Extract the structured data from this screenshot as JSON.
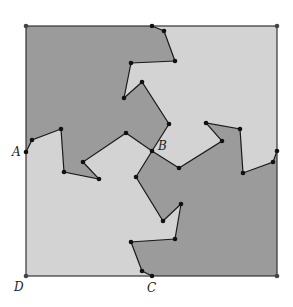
{
  "diagram": {
    "colors": {
      "light": "#d3d3d3",
      "dark": "#9b9b9b",
      "stroke": "#1a1a1a",
      "dot": "#111111",
      "corner_dot": "#444444"
    },
    "square": {
      "x1": 26,
      "y1": 26,
      "x2": 277,
      "y2": 276
    },
    "labels": [
      {
        "text": "A",
        "x": 12,
        "y": 156
      },
      {
        "text": "B",
        "x": 158,
        "y": 150
      },
      {
        "text": "C",
        "x": 147,
        "y": 292
      },
      {
        "text": "D",
        "x": 14,
        "y": 291
      }
    ],
    "vertices": {
      "top": [
        [
          152,
          26
        ],
        [
          164,
          31
        ],
        [
          175,
          61
        ],
        [
          131,
          63
        ],
        [
          124,
          98
        ],
        [
          142,
          82
        ],
        [
          169,
          124
        ],
        [
          152,
          151
        ]
      ],
      "left": [
        [
          26,
          152
        ],
        [
          32,
          140
        ],
        [
          61,
          129
        ],
        [
          64,
          172
        ],
        [
          99,
          179
        ],
        [
          83,
          162
        ],
        [
          126,
          133
        ],
        [
          152,
          151
        ]
      ],
      "bottom": [
        [
          152,
          276
        ],
        [
          142,
          271
        ],
        [
          131,
          242
        ],
        [
          175,
          239
        ],
        [
          181,
          204
        ],
        [
          163,
          221
        ],
        [
          136,
          177
        ],
        [
          152,
          151
        ]
      ],
      "right": [
        [
          277,
          151
        ],
        [
          273,
          162
        ],
        [
          243,
          173
        ],
        [
          240,
          129
        ],
        [
          206,
          123
        ],
        [
          222,
          141
        ],
        [
          179,
          168
        ],
        [
          152,
          151
        ]
      ]
    },
    "corners": [
      [
        26,
        26
      ],
      [
        277,
        26
      ],
      [
        277,
        276
      ],
      [
        26,
        276
      ]
    ]
  }
}
